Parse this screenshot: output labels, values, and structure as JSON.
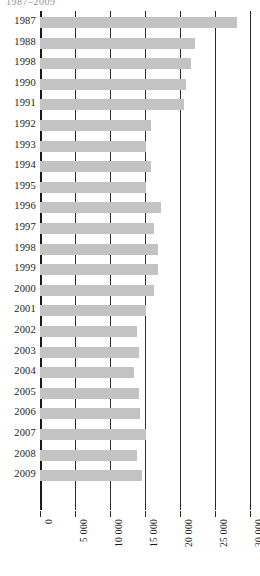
{
  "title_fragment": "1987–2009",
  "chart_data": {
    "type": "bar",
    "orientation": "horizontal",
    "title": "1987–2009",
    "xlabel": "",
    "ylabel": "",
    "xlim": [
      0,
      30000
    ],
    "grid": true,
    "legend": null,
    "bar_color": "#c3c3c3",
    "axis_color": "#2b2b2b",
    "xticks": [
      0,
      5000,
      10000,
      15000,
      20000,
      25000,
      30000
    ],
    "xtick_labels": [
      "0",
      "5 000",
      "10 000",
      "15 000",
      "20 000",
      "25 000",
      "30 000"
    ],
    "categories": [
      "1987",
      "1988",
      "1998",
      "1990",
      "1991",
      "1992",
      "1993",
      "1994",
      "1995",
      "1996",
      "1997",
      "1998",
      "1999",
      "2000",
      "2001",
      "2002",
      "2003",
      "2004",
      "2005",
      "2006",
      "2007",
      "2008",
      "2009"
    ],
    "values": [
      28200,
      22100,
      21600,
      20900,
      20500,
      15900,
      15200,
      15800,
      15100,
      17300,
      16300,
      16900,
      16900,
      16300,
      15100,
      13800,
      14200,
      13400,
      14100,
      14300,
      15100,
      13900,
      14500
    ]
  }
}
